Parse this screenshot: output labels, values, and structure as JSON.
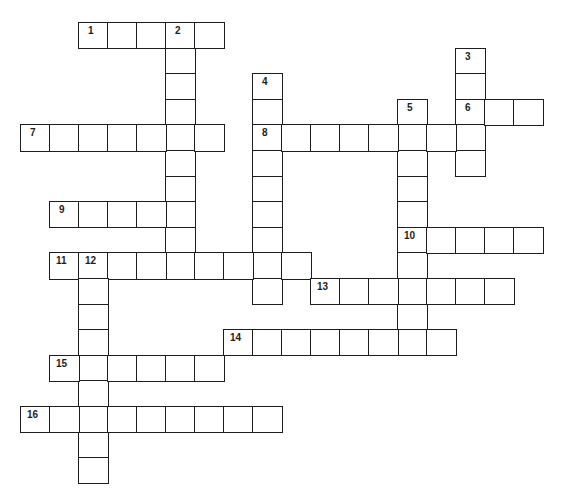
{
  "puzzle": {
    "type": "crossword",
    "grid_origin": {
      "x": 20,
      "y": 22
    },
    "cell_size": {
      "w": 29,
      "h": 25.6
    },
    "colors": {
      "border": "#1e1e1e",
      "cell_fill": "#ffffff",
      "label": "#1e1e1e"
    },
    "entries": [
      {
        "number": 1,
        "direction": "across",
        "row": 0,
        "col": 2,
        "length": 5
      },
      {
        "number": 2,
        "direction": "down",
        "row": 0,
        "col": 5,
        "length": 10
      },
      {
        "number": 3,
        "direction": "down",
        "row": 1,
        "col": 15,
        "length": 5
      },
      {
        "number": 4,
        "direction": "down",
        "row": 2,
        "col": 8,
        "length": 9
      },
      {
        "number": 5,
        "direction": "down",
        "row": 3,
        "col": 13,
        "length": 10
      },
      {
        "number": 6,
        "direction": "across",
        "row": 3,
        "col": 15,
        "length": 3
      },
      {
        "number": 7,
        "direction": "across",
        "row": 4,
        "col": 0,
        "length": 7
      },
      {
        "number": 8,
        "direction": "across",
        "row": 4,
        "col": 8,
        "length": 8
      },
      {
        "number": 9,
        "direction": "across",
        "row": 7,
        "col": 1,
        "length": 5
      },
      {
        "number": 10,
        "direction": "across",
        "row": 8,
        "col": 13,
        "length": 5
      },
      {
        "number": 11,
        "direction": "across",
        "row": 9,
        "col": 1,
        "length": 9
      },
      {
        "number": 12,
        "direction": "down",
        "row": 9,
        "col": 2,
        "length": 9
      },
      {
        "number": 13,
        "direction": "across",
        "row": 10,
        "col": 10,
        "length": 7
      },
      {
        "number": 14,
        "direction": "across",
        "row": 12,
        "col": 7,
        "length": 8
      },
      {
        "number": 15,
        "direction": "across",
        "row": 13,
        "col": 1,
        "length": 6
      },
      {
        "number": 16,
        "direction": "across",
        "row": 15,
        "col": 0,
        "length": 9
      }
    ]
  }
}
